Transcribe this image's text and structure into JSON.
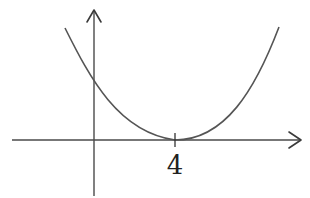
{
  "diagram": {
    "type": "function-graph",
    "x_axis": {
      "arrow": true
    },
    "y_axis": {
      "arrow": true
    },
    "ticks": [
      {
        "position": 4,
        "label": "4"
      }
    ],
    "curve": {
      "shape": "upward-opening, flat-bottomed (e.g. (x-4)^4 or (x-4)^2)",
      "minimum_x": 4,
      "minimum_y": 0,
      "positive_y_intercept": true
    },
    "colors": {
      "axes": "#4a4a4a",
      "curve": "#555555",
      "label": "#222222",
      "background": "#ffffff"
    }
  }
}
